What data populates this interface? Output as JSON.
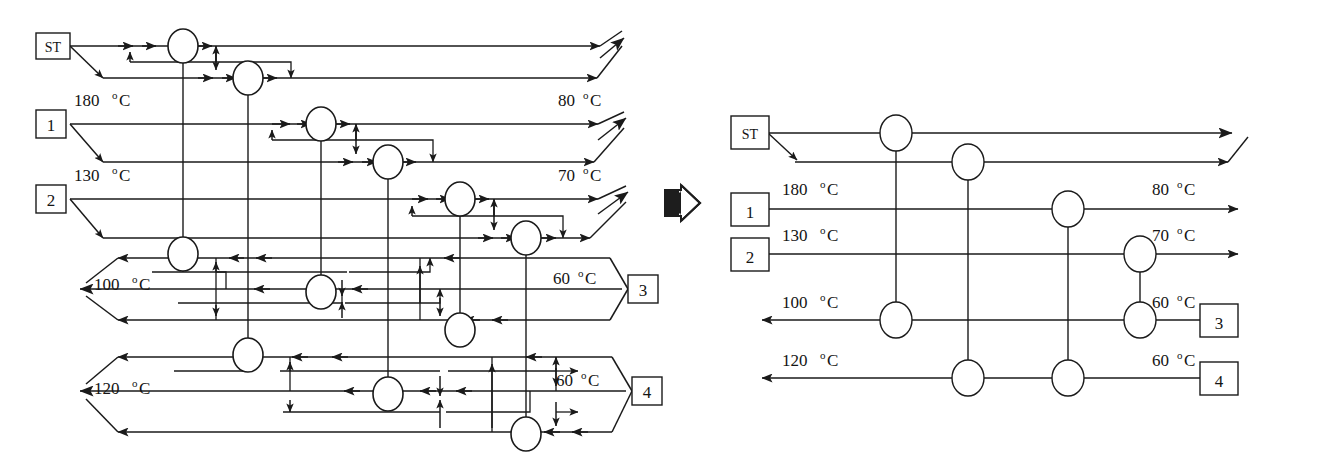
{
  "figure": {
    "transform_icon": "right-block-arrow-icon",
    "colors": {
      "line": "#1a1a1a",
      "text": "#141414",
      "background": "#ffffff"
    }
  },
  "degree_symbol": "o",
  "celsius": "C",
  "left_network": {
    "name": "complex-heat-exchanger-network",
    "source_boxes": [
      {
        "id": "ST",
        "label": "ST"
      },
      {
        "id": "1",
        "label": "1"
      },
      {
        "id": "2",
        "label": "2"
      }
    ],
    "sink_boxes": [
      {
        "id": "3",
        "label": "3"
      },
      {
        "id": "4",
        "label": "4"
      }
    ],
    "inlet_temperatures": [
      {
        "stream": "1",
        "value": "180 C",
        "number": "180"
      },
      {
        "stream": "2",
        "value": "130 C",
        "number": "130"
      }
    ],
    "outlet_temperatures": [
      {
        "stream": "1",
        "value": "80 C",
        "number": "80"
      },
      {
        "stream": "2",
        "value": "70 C",
        "number": "70"
      }
    ],
    "cold_inlet_temperatures": [
      {
        "stream": "3",
        "value": "60 C",
        "number": "60"
      },
      {
        "stream": "4",
        "value": "60 C",
        "number": "60"
      }
    ],
    "cold_outlet_temperatures": [
      {
        "stream": "3",
        "value": "100 C",
        "number": "100"
      },
      {
        "stream": "4",
        "value": "120 C",
        "number": "120"
      }
    ],
    "exchanger_count": 14
  },
  "right_network": {
    "name": "simplified-heat-exchanger-network",
    "source_boxes": [
      {
        "id": "ST",
        "label": "ST"
      },
      {
        "id": "1",
        "label": "1"
      },
      {
        "id": "2",
        "label": "2"
      }
    ],
    "sink_boxes": [
      {
        "id": "3",
        "label": "3"
      },
      {
        "id": "4",
        "label": "4"
      }
    ],
    "inlet_temperatures": [
      {
        "stream": "1",
        "value": "180 C",
        "number": "180"
      },
      {
        "stream": "2",
        "value": "130 C",
        "number": "130"
      }
    ],
    "outlet_temperatures": [
      {
        "stream": "1",
        "value": "80 C",
        "number": "80"
      },
      {
        "stream": "2",
        "value": "70 C",
        "number": "70"
      }
    ],
    "cold_inlet_temperatures": [
      {
        "stream": "3",
        "value": "60 C",
        "number": "60"
      },
      {
        "stream": "4",
        "value": "60 C",
        "number": "60"
      }
    ],
    "cold_outlet_temperatures": [
      {
        "stream": "3",
        "value": "100 C",
        "number": "100"
      },
      {
        "stream": "4",
        "value": "120 C",
        "number": "120"
      }
    ],
    "exchanger_count": 8
  },
  "labels": {
    "st": "ST",
    "one": "1",
    "two": "2",
    "three": "3",
    "four": "4",
    "t180": "180",
    "t130": "130",
    "t80": "80",
    "t70": "70",
    "t100": "100",
    "t120": "120",
    "t60a": "60",
    "t60b": "60",
    "r_t180": "180",
    "r_t130": "130",
    "r_t80": "80",
    "r_t70": "70",
    "r_t100": "100",
    "r_t120": "120",
    "r_t60a": "60",
    "r_t60b": "60"
  }
}
